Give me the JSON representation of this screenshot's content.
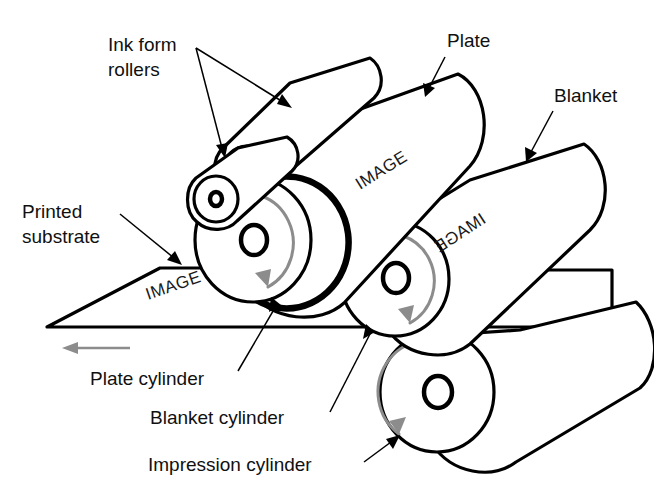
{
  "diagram": {
    "background_color": "#ffffff",
    "line_color": "#000000",
    "rotation_arrow_color": "#8c8c8c"
  },
  "labels": {
    "ink_form_rollers_line1": "Ink form",
    "ink_form_rollers_line2": "rollers",
    "plate": "Plate",
    "blanket": "Blanket",
    "printed_substrate_line1": "Printed",
    "printed_substrate_line2": "substrate",
    "plate_cylinder": "Plate cylinder",
    "blanket_cylinder": "Blanket cylinder",
    "impression_cylinder": "Impression cylinder"
  },
  "image_marks": {
    "plate_cylinder_image": "IMAGE",
    "blanket_cylinder_image": "IMAGE",
    "substrate_image": "IMAGE"
  },
  "components": [
    {
      "name": "ink-form-roller-upper",
      "kind": "roller"
    },
    {
      "name": "ink-form-roller-lower",
      "kind": "roller"
    },
    {
      "name": "plate-cylinder",
      "kind": "cylinder",
      "image_orientation": "right-reading"
    },
    {
      "name": "blanket-cylinder",
      "kind": "cylinder",
      "image_orientation": "mirrored"
    },
    {
      "name": "impression-cylinder",
      "kind": "cylinder"
    },
    {
      "name": "printed-substrate",
      "kind": "sheet",
      "image_orientation": "right-reading"
    }
  ],
  "rotation": {
    "plate_cylinder": "clockwise",
    "blanket_cylinder": "clockwise",
    "impression_cylinder": "counter-clockwise"
  },
  "substrate_feed_direction": "leftward"
}
